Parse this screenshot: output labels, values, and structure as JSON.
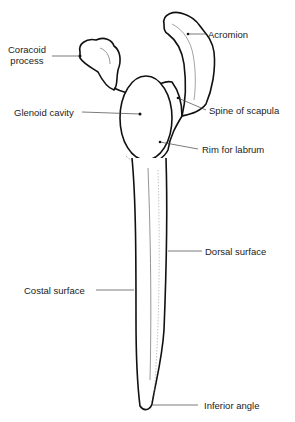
{
  "diagram": {
    "labels": {
      "coracoid_line1": "Coracoid",
      "coracoid_line2": "process",
      "acromion": "Acromion",
      "glenoid_cavity": "Glenoid cavity",
      "spine_of_scapula": "Spine of scapula",
      "rim_for_labrum": "Rim for labrum",
      "dorsal_surface": "Dorsal surface",
      "costal_surface": "Costal surface",
      "inferior_angle": "Inferior angle"
    },
    "colors": {
      "line": "#111111",
      "text": "#222222",
      "leader": "#444444"
    }
  }
}
